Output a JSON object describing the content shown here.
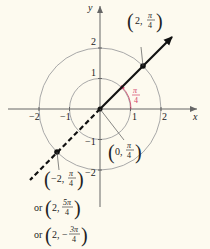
{
  "colors": {
    "background": "#fdfaef",
    "axis": "#666666",
    "circle": "#a8a8a8",
    "ray": "#111111",
    "angle_label": "#d2436a",
    "leader": "#555555"
  },
  "axes": {
    "x_label": "x",
    "y_label": "y",
    "x_ticks": [
      "−2",
      "−1",
      "1",
      "2"
    ],
    "y_ticks": [
      "2",
      "1",
      "−1",
      "−2"
    ]
  },
  "circles": [
    {
      "name": "unit-circle",
      "r": 1
    },
    {
      "name": "radius-2-circle",
      "r": 2
    }
  ],
  "angle": {
    "numerator": "π",
    "denominator": "4"
  },
  "labels": {
    "point_a": {
      "prefix": "2,",
      "num": "π",
      "den": "4"
    },
    "origin": {
      "prefix": "0,",
      "num": "π",
      "den": "4"
    },
    "point_b": {
      "prefix": "−2,",
      "num": "π",
      "den": "4"
    },
    "alt1": {
      "or": "or",
      "prefix": "2,",
      "num": "5π",
      "den": "4"
    },
    "alt2": {
      "or": "or",
      "prefix": "2, −",
      "num": "3π",
      "den": "4"
    }
  }
}
